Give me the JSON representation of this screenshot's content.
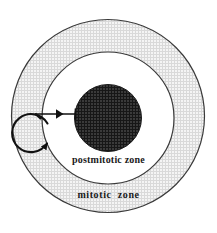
{
  "figure": {
    "background_color": "#ffffff"
  },
  "zones": {
    "outer": {
      "label": "mitotic  zone",
      "name": "mitotic zone",
      "fill_color": "#f0f0f0",
      "stipple_color": "#c8c8c8",
      "stroke_color": "#3a3a3a",
      "center_x": 108,
      "center_y": 116,
      "radius": 97
    },
    "middle": {
      "label": "postmitotic zone",
      "name": "postmitotic zone",
      "fill_color": "#ffffff",
      "stroke_color": "#3a3a3a",
      "center_x": 108,
      "center_y": 118,
      "radius": 66
    },
    "core": {
      "label": "",
      "name": "dark core",
      "fill_color": "#2e2e2e",
      "hatch_color": "#1a1a1a",
      "stroke_color": "#1a1a1a",
      "center_x": 108,
      "center_y": 118,
      "radius": 34
    }
  },
  "annotations": {
    "cycle_arrow": {
      "name": "self-renewal cycle arrow",
      "center_x": 35,
      "center_y": 133,
      "radius": 19,
      "stroke_color": "#111111"
    },
    "transit_arrow": {
      "name": "differentiation arrow",
      "from_x": 35,
      "from_y": 114,
      "to_x": 76,
      "to_y": 114,
      "stroke_color": "#111111"
    }
  },
  "labels": {
    "postmitotic": "postmitotic zone",
    "mitotic": "mitotic  zone"
  }
}
